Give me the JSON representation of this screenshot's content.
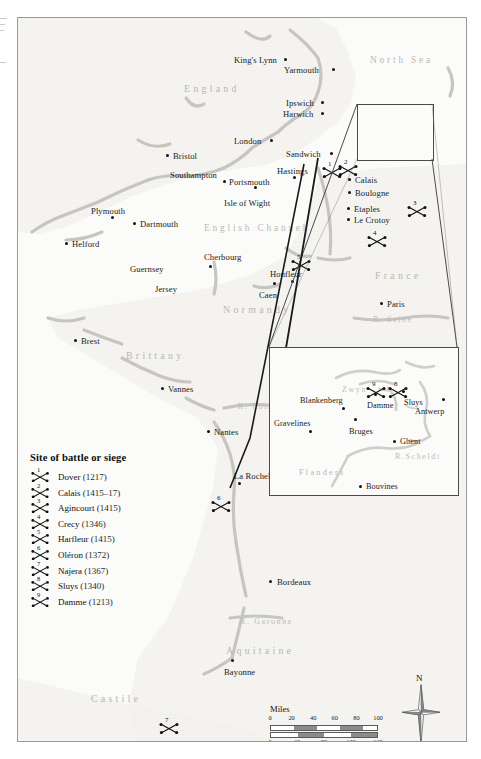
{
  "map": {
    "seas": [
      {
        "name": "North Sea",
        "x": 352,
        "y": 38
      },
      {
        "name": "English Channel",
        "x": 186,
        "y": 206
      }
    ],
    "regions": [
      {
        "name": "England",
        "x": 166,
        "y": 66,
        "size": "lg"
      },
      {
        "name": "France",
        "x": 357,
        "y": 253,
        "size": "lg"
      },
      {
        "name": "Normandy",
        "x": 205,
        "y": 287,
        "size": "lg"
      },
      {
        "name": "Brittany",
        "x": 108,
        "y": 333,
        "size": "lg"
      },
      {
        "name": "Aquitaine",
        "x": 208,
        "y": 628,
        "size": "lg"
      },
      {
        "name": "Castile",
        "x": 73,
        "y": 676,
        "size": "lg"
      }
    ],
    "rivers": [
      {
        "name": "R. Seine",
        "x": 355,
        "y": 298
      },
      {
        "name": "R. Loire",
        "x": 220,
        "y": 385
      },
      {
        "name": "R. Garonne",
        "x": 222,
        "y": 600
      }
    ],
    "cities": [
      {
        "name": "King's Lynn",
        "lx": 216,
        "ly": 38,
        "dx": 266,
        "dy": 40,
        "anchor": "right"
      },
      {
        "name": "Yarmouth",
        "lx": 266,
        "ly": 48,
        "dx": 314,
        "dy": 50,
        "anchor": "right"
      },
      {
        "name": "Ipswich",
        "lx": 268,
        "ly": 81,
        "dx": 303,
        "dy": 83,
        "anchor": "right"
      },
      {
        "name": "Harwich",
        "lx": 265,
        "ly": 92,
        "dx": 303,
        "dy": 94,
        "anchor": "right"
      },
      {
        "name": "London",
        "lx": 216,
        "ly": 119,
        "dx": 252,
        "dy": 121,
        "anchor": "right"
      },
      {
        "name": "Sandwich",
        "lx": 268,
        "ly": 132,
        "dx": 312,
        "dy": 134,
        "anchor": "right"
      },
      {
        "name": "Bristol",
        "lx": 155,
        "ly": 134,
        "dx": 148,
        "dy": 136,
        "anchor": "left"
      },
      {
        "name": "Hastings",
        "lx": 259,
        "ly": 149,
        "dx": 275,
        "dy": 158,
        "anchor": "below"
      },
      {
        "name": "Southampton",
        "lx": 152,
        "ly": 153,
        "dx": 205,
        "dy": 162,
        "anchor": "below"
      },
      {
        "name": "Portsmouth",
        "lx": 211,
        "ly": 160,
        "dx": 236,
        "dy": 168,
        "anchor": "below"
      },
      {
        "name": "Isle of Wight",
        "lx": 206,
        "ly": 181,
        "dx": 0,
        "dy": 0,
        "anchor": "none"
      },
      {
        "name": "Calais",
        "lx": 337,
        "ly": 158,
        "dx": 330,
        "dy": 160,
        "anchor": "left"
      },
      {
        "name": "Boulogne",
        "lx": 337,
        "ly": 171,
        "dx": 330,
        "dy": 173,
        "anchor": "left"
      },
      {
        "name": "Etaples",
        "lx": 336,
        "ly": 187,
        "dx": 329,
        "dy": 189,
        "anchor": "left"
      },
      {
        "name": "Le Crotoy",
        "lx": 336,
        "ly": 198,
        "dx": 329,
        "dy": 200,
        "anchor": "left"
      },
      {
        "name": "Plymouth",
        "lx": 73,
        "ly": 189,
        "dx": 93,
        "dy": 198,
        "anchor": "below"
      },
      {
        "name": "Dartmouth",
        "lx": 122,
        "ly": 202,
        "dx": 115,
        "dy": 204,
        "anchor": "left"
      },
      {
        "name": "Helford",
        "lx": 54,
        "ly": 222,
        "dx": 47,
        "dy": 224,
        "anchor": "left"
      },
      {
        "name": "Cherbourg",
        "lx": 186,
        "ly": 235,
        "dx": 191,
        "dy": 247,
        "anchor": "below"
      },
      {
        "name": "Guernsey",
        "lx": 112,
        "ly": 247,
        "dx": 0,
        "dy": 0,
        "anchor": "none"
      },
      {
        "name": "Honfleur",
        "lx": 252,
        "ly": 252,
        "dx": 273,
        "dy": 262,
        "anchor": "below"
      },
      {
        "name": "Jersey",
        "lx": 137,
        "ly": 267,
        "dx": 0,
        "dy": 0,
        "anchor": "none"
      },
      {
        "name": "Caen",
        "lx": 241,
        "ly": 273,
        "dx": 255,
        "dy": 264,
        "anchor": "above"
      },
      {
        "name": "Paris",
        "lx": 369,
        "ly": 282,
        "dx": 362,
        "dy": 284,
        "anchor": "left"
      },
      {
        "name": "Brest",
        "lx": 63,
        "ly": 319,
        "dx": 56,
        "dy": 321,
        "anchor": "left"
      },
      {
        "name": "Vannes",
        "lx": 150,
        "ly": 367,
        "dx": 143,
        "dy": 369,
        "anchor": "left"
      },
      {
        "name": "Nantes",
        "lx": 196,
        "ly": 410,
        "dx": 189,
        "dy": 412,
        "anchor": "left"
      },
      {
        "name": "La Rochelle",
        "lx": 216,
        "ly": 454,
        "dx": 220,
        "dy": 464,
        "anchor": "below"
      },
      {
        "name": "Bordeaux",
        "lx": 259,
        "ly": 560,
        "dx": 251,
        "dy": 562,
        "anchor": "left"
      },
      {
        "name": "Bayonne",
        "lx": 206,
        "ly": 650,
        "dx": 213,
        "dy": 641,
        "anchor": "above"
      },
      {
        "name": "Burgos",
        "lx": 56,
        "ly": 727,
        "dx": 49,
        "dy": 729,
        "anchor": "left"
      }
    ],
    "markers": [
      {
        "n": "1",
        "x": 303,
        "y": 144
      },
      {
        "n": "2",
        "x": 319,
        "y": 142
      },
      {
        "n": "3",
        "x": 388,
        "y": 183
      },
      {
        "n": "4",
        "x": 348,
        "y": 213
      },
      {
        "n": "5",
        "x": 272,
        "y": 237
      },
      {
        "n": "6",
        "x": 192,
        "y": 478
      },
      {
        "n": "7",
        "x": 140,
        "y": 700
      }
    ]
  },
  "inset": {
    "regions": [
      {
        "name": "Flanders",
        "x": 29,
        "y": 121
      }
    ],
    "rivers": [
      {
        "name": "R.Scheldt",
        "x": 125,
        "y": 105
      },
      {
        "name": "Zwyn",
        "x": 72,
        "y": 38
      }
    ],
    "cities": [
      {
        "name": "Blankenberg",
        "lx": 30,
        "ly": 49,
        "dx": 72,
        "dy": 59,
        "anchor": "below"
      },
      {
        "name": "Gravelines",
        "lx": 4,
        "ly": 72,
        "dx": 39,
        "dy": 82,
        "anchor": "below"
      },
      {
        "name": "Bruges",
        "lx": 79,
        "ly": 80,
        "dx": 84,
        "dy": 70,
        "anchor": "above"
      },
      {
        "name": "Damme",
        "lx": 97,
        "ly": 54,
        "dx": 104,
        "dy": 45,
        "anchor": "above"
      },
      {
        "name": "Sluys",
        "lx": 134,
        "ly": 51,
        "dx": 132,
        "dy": 42,
        "anchor": "above"
      },
      {
        "name": "Antwerp",
        "lx": 145,
        "ly": 60,
        "dx": 172,
        "dy": 50,
        "anchor": "below"
      },
      {
        "name": "Ghent",
        "lx": 130,
        "ly": 90,
        "dx": 123,
        "dy": 92,
        "anchor": "left"
      },
      {
        "name": "Bouvines",
        "lx": 96,
        "ly": 135,
        "dx": 89,
        "dy": 137,
        "anchor": "left"
      }
    ],
    "markers": [
      {
        "n": "9",
        "x": 95,
        "y": 34
      },
      {
        "n": "8",
        "x": 117,
        "y": 34
      }
    ]
  },
  "legend": {
    "title": "Site of battle or siege",
    "entries": [
      {
        "n": "1",
        "place": "Dover",
        "date": "(1217)"
      },
      {
        "n": "2",
        "place": "Calais",
        "date": "(1415–17)"
      },
      {
        "n": "3",
        "place": "Agincourt",
        "date": "(1415)"
      },
      {
        "n": "4",
        "place": "Crecy",
        "date": "(1346)"
      },
      {
        "n": "5",
        "place": "Harfleur",
        "date": "(1415)"
      },
      {
        "n": "6",
        "place": "Oléron",
        "date": "(1372)"
      },
      {
        "n": "7",
        "place": "Najera",
        "date": "(1367)"
      },
      {
        "n": "8",
        "place": "Sluys",
        "date": "(1340)"
      },
      {
        "n": "9",
        "place": "Damme",
        "date": "(1213)"
      }
    ]
  },
  "scale": {
    "miles_label": "Miles",
    "km_label": "Kilometres",
    "miles_ticks": [
      "0",
      "20",
      "40",
      "60",
      "80",
      "100"
    ],
    "km_ticks": [
      "0",
      "40",
      "80",
      "120",
      "160"
    ]
  },
  "compass": {
    "north_label": "N"
  }
}
